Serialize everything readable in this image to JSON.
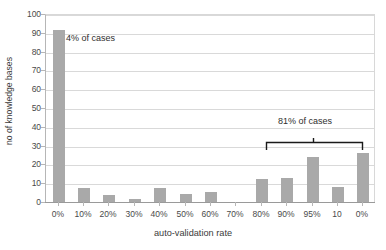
{
  "chart_data": {
    "type": "bar",
    "title": "",
    "xlabel": "auto-validation rate",
    "ylabel": "no of knowledge bases",
    "categories": [
      "0%",
      "10%",
      "20%",
      "30%",
      "40%",
      "50%",
      "60%",
      "70%",
      "80%",
      "90%",
      "95%",
      "10",
      "0%"
    ],
    "values": [
      91.5,
      7.5,
      3.5,
      1.5,
      7.3,
      4.2,
      5.3,
      0,
      12.2,
      13,
      24.2,
      8,
      26
    ],
    "ylim": [
      0,
      100
    ],
    "yticks": [
      0,
      10,
      20,
      30,
      40,
      50,
      60,
      70,
      80,
      90,
      100
    ],
    "ytick_labels": [
      "0",
      "10",
      "20",
      "30",
      "40",
      "50",
      "60",
      "70",
      "80",
      "90",
      "100"
    ],
    "grid": true,
    "legend": "none",
    "bar_color": "#a9a9a9",
    "grid_color": "#d9d9d9",
    "annotations": [
      {
        "id": "left",
        "text": "4% of cases",
        "refers_to_category": "0%",
        "value_percent": 4
      },
      {
        "id": "right",
        "text": "81% of cases",
        "refers_to_categories": [
          "80%",
          "90%",
          "95%",
          "10",
          "0%"
        ],
        "value_percent": 81,
        "has_brace": true
      }
    ]
  },
  "axes": {
    "x_title": "auto-validation rate",
    "y_title": "no of knowledge bases"
  },
  "annotations": {
    "left_label": "4% of cases",
    "right_label": "81% of cases"
  }
}
